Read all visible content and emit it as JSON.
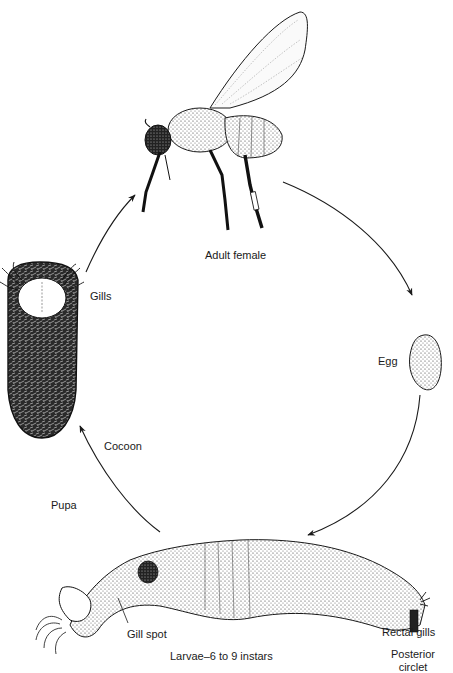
{
  "diagram": {
    "type": "life-cycle",
    "stages": [
      {
        "id": "adult",
        "label": "Adult female"
      },
      {
        "id": "egg",
        "label": "Egg"
      },
      {
        "id": "larva",
        "label": "Larvae–6 to 9 instars"
      },
      {
        "id": "pupa",
        "label": "Pupa"
      }
    ],
    "annotations": {
      "gills": "Gills",
      "cocoon": "Cocoon",
      "gill_spot": "Gill spot",
      "rectal_gills": "Rectal gills",
      "posterior_circlet_line1": "Posterior",
      "posterior_circlet_line2": "circlet"
    },
    "flow": [
      "adult",
      "egg",
      "larva",
      "pupa",
      "adult"
    ],
    "colors": {
      "ink": "#1a1a1a",
      "background": "#ffffff"
    }
  }
}
